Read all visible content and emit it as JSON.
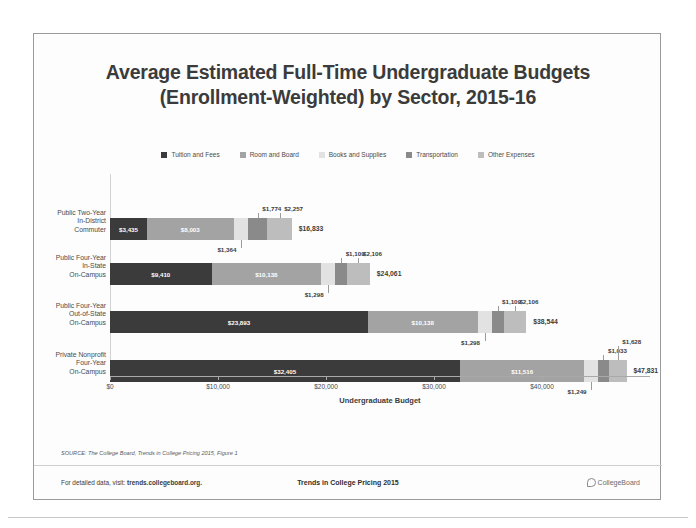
{
  "slide": {
    "title_line1": "Average Estimated Full-Time Undergraduate Budgets",
    "title_line2": "(Enrollment-Weighted) by Sector, 2015-16",
    "source_note": "SOURCE: The College Board, Trends in College Pricing 2015, Figure 1",
    "footer": {
      "left_prefix": "For detailed data, visit:",
      "left_link": "trends.collegeboard.org.",
      "center": "Trends in College Pricing 2015",
      "right_logo_text": "CollegeBoard"
    }
  },
  "chart_data": {
    "type": "bar",
    "orientation": "horizontal",
    "stacked": true,
    "title": "Average Estimated Full-Time Undergraduate Budgets (Enrollment-Weighted) by Sector, 2015-16",
    "xlabel": "Undergraduate Budget",
    "ylabel": "",
    "xlim": [
      0,
      50000
    ],
    "xticks": [
      0,
      10000,
      20000,
      30000,
      40000
    ],
    "xticklabels": [
      "$0",
      "$10,000",
      "$20,000",
      "$30,000",
      "$40,000"
    ],
    "grid": false,
    "legend_position": "top-center",
    "categories": [
      "Public Two-Year In-District Commuter",
      "Public Four-Year In-State On-Campus",
      "Public Four-Year Out-of-State On-Campus",
      "Private Nonprofit Four-Year On-Campus"
    ],
    "category_lines": [
      [
        "Public Two-Year",
        "In-District",
        "Commuter"
      ],
      [
        "Public Four-Year",
        "In-State",
        "On-Campus"
      ],
      [
        "Public Four-Year",
        "Out-of-State",
        "On-Campus"
      ],
      [
        "Private Nonprofit",
        "Four-Year",
        "On-Campus"
      ]
    ],
    "series": [
      {
        "name": "Tuition and Fees",
        "color": "#3b3b3b",
        "values": [
          3435,
          9410,
          23893,
          32405
        ],
        "labels": [
          "$3,435",
          "$9,410",
          "$23,893",
          "$32,405"
        ]
      },
      {
        "name": "Room and Board",
        "color": "#a3a3a3",
        "values": [
          8003,
          10138,
          10138,
          11516
        ],
        "labels": [
          "$8,003",
          "$10,138",
          "$10,138",
          "$11,516"
        ]
      },
      {
        "name": "Books and Supplies",
        "color": "#e2e2e2",
        "values": [
          1364,
          1298,
          1298,
          1249
        ],
        "labels": [
          "$1,364",
          "$1,298",
          "$1,298",
          "$1,249"
        ]
      },
      {
        "name": "Transportation",
        "color": "#8a8a8a",
        "values": [
          1774,
          1109,
          1109,
          1033
        ],
        "labels": [
          "$1,774",
          "$1,109",
          "$1,109",
          "$1,033"
        ]
      },
      {
        "name": "Other Expenses",
        "color": "#bdbdbd",
        "values": [
          2257,
          2106,
          2106,
          1628
        ],
        "labels": [
          "$2,257",
          "$2,106",
          "$2,106",
          "$1,628"
        ]
      }
    ],
    "totals": [
      16833,
      24061,
      38544,
      47831
    ],
    "total_labels": [
      "$16,833",
      "$24,061",
      "$38,544",
      "$47,831"
    ]
  }
}
